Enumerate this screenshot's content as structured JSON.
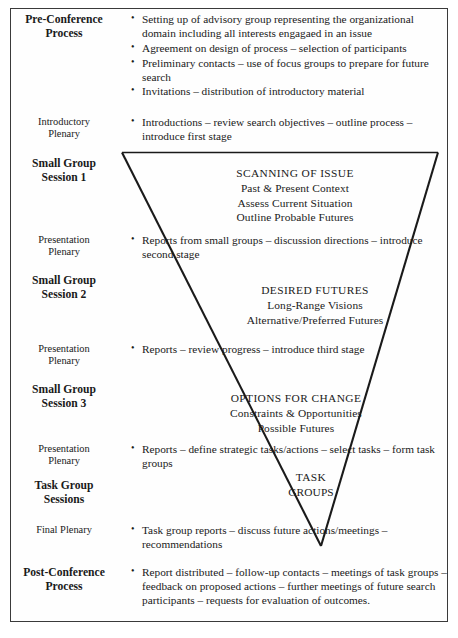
{
  "diagram": {
    "border_color": "#3a3a3a",
    "line_color": "#1a1a1a",
    "background": "#ffffff"
  },
  "rows": [
    {
      "label": "Pre-Conference Process",
      "label_style": "bold",
      "bullets": [
        "Setting up of advisory group representing the organizational domain including all interests engagaed in an issue",
        "Agreement on design of process – selection of participants",
        "Preliminary contacts – use of focus groups to prepare for future search",
        "Invitations – distribution of introductory material"
      ]
    },
    {
      "label": "Introductory Plenary",
      "label_style": "light",
      "bullets": [
        "Introductions – review search objectives – outline process – introduce first stage"
      ]
    },
    {
      "label": "Small Group Session 1",
      "label_style": "bold",
      "bullets": []
    },
    {
      "label": "Presentation Plenary",
      "label_style": "light",
      "bullets": [
        "Reports from small groups – discussion directions – introduce second stage"
      ]
    },
    {
      "label": "Small Group Session 2",
      "label_style": "bold",
      "bullets": []
    },
    {
      "label": "Presentation Plenary",
      "label_style": "light",
      "bullets": [
        "Reports – review progress – introduce third stage"
      ]
    },
    {
      "label": "Small Group Session 3",
      "label_style": "bold",
      "bullets": []
    },
    {
      "label": "Presentation Plenary",
      "label_style": "light",
      "bullets": [
        "Reports – define strategic tasks/actions – select tasks – form task groups"
      ]
    },
    {
      "label": "Task Group Sessions",
      "label_style": "bold",
      "bullets": []
    },
    {
      "label": "Final Plenary",
      "label_style": "light",
      "bullets": [
        "Task group reports – discuss future actions/meetings – recommendations"
      ]
    },
    {
      "label": "Post-Conference Process",
      "label_style": "bold",
      "bullets": [
        "Report distributed – follow-up contacts – meetings of task groups – feedback on proposed actions – further meetings of future search participants – requests for evaluation of outcomes."
      ]
    }
  ],
  "stages": [
    {
      "head": "SCANNING OF ISSUE",
      "lines": [
        "Past & Present Context",
        "Assess Current Situation",
        "Outline Probable Futures"
      ]
    },
    {
      "head": "DESIRED FUTURES",
      "lines": [
        "Long-Range Visions",
        "Alternative/Preferred Futures"
      ]
    },
    {
      "head": "OPTIONS FOR CHANGE",
      "lines": [
        "Constraints & Opportunities",
        "Possible Futures"
      ]
    },
    {
      "head": "TASK",
      "lines": [
        "GROUPS"
      ]
    }
  ],
  "funnel": {
    "top_left_x": 122,
    "top_right_x": 438,
    "top_y": 152,
    "apex_x": 321,
    "apex_y": 546
  }
}
